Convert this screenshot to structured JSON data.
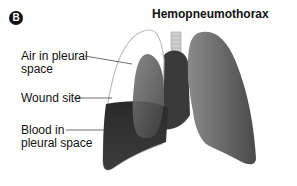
{
  "figure": {
    "panel_letter": "B",
    "title": "Hemopneumothorax"
  },
  "labels": [
    {
      "id": "air",
      "line1": "Air in pleural",
      "line2": "space"
    },
    {
      "id": "wound",
      "line1": "Wound site",
      "line2": ""
    },
    {
      "id": "blood",
      "line1": "Blood in",
      "line2": "pleural space"
    }
  ],
  "colors": {
    "lung_dark": "#3a3a3a",
    "lung_mid": "#6e6e6e",
    "lung_light": "#a8a8a8",
    "blood": "#1e1e1e",
    "pleura_outline": "#bdbdbd",
    "text": "#111111"
  }
}
